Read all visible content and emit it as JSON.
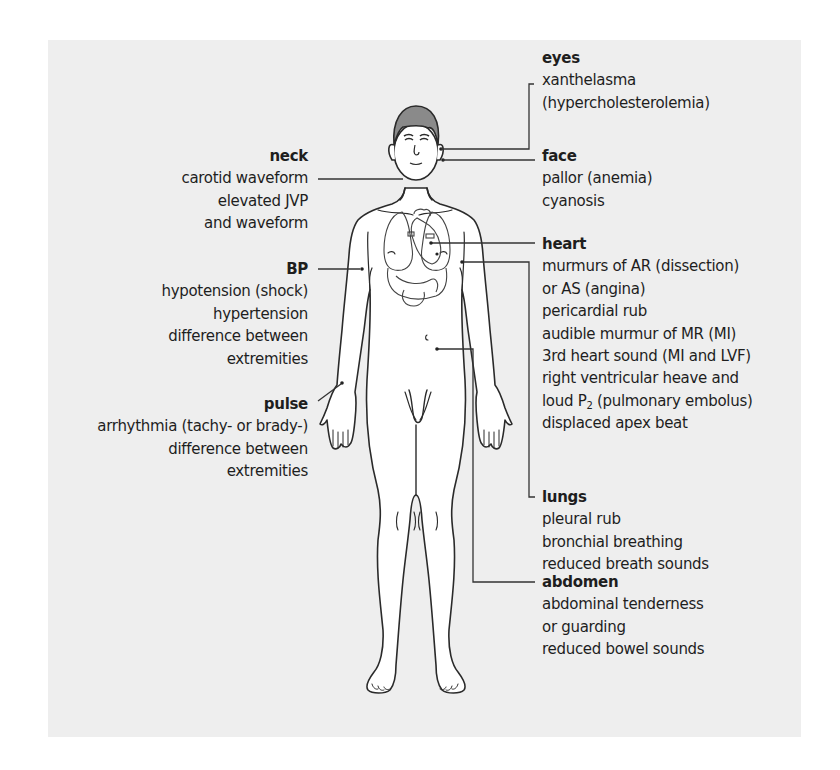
{
  "colors": {
    "panel_bg": "#eeeeee",
    "page_bg": "#ffffff",
    "text": "#1e1e1e",
    "line": "#333333",
    "hair": "#8a8a8a",
    "skin": "#ffffff"
  },
  "labels": {
    "eyes": {
      "title": "eyes",
      "lines": [
        "xanthelasma",
        "(hypercholesterolemia)"
      ]
    },
    "face": {
      "title": "face",
      "lines": [
        "pallor (anemia)",
        "cyanosis"
      ]
    },
    "heart": {
      "title": "heart",
      "lines": [
        "murmurs of AR (dissection)",
        "or AS (angina)",
        "pericardial rub",
        "audible murmur of MR (MI)",
        "3rd heart sound (MI and LVF)",
        "right ventricular heave and",
        "loud P",
        "displaced apex beat"
      ],
      "p2_sub": "2",
      "p2_rest": " (pulmonary embolus)"
    },
    "lungs": {
      "title": "lungs",
      "lines": [
        "pleural rub",
        "bronchial breathing",
        "reduced breath sounds"
      ]
    },
    "abdomen": {
      "title": "abdomen",
      "lines": [
        "abdominal tenderness",
        "or guarding",
        "reduced bowel sounds"
      ]
    },
    "neck": {
      "title": "neck",
      "lines": [
        "carotid waveform",
        "elevated JVP",
        "and waveform"
      ]
    },
    "bp": {
      "title": "BP",
      "lines": [
        "hypotension (shock)",
        "hypertension",
        "difference between",
        "extremities"
      ]
    },
    "pulse": {
      "title": "pulse",
      "lines": [
        "arrhythmia (tachy- or brady-)",
        "difference between",
        "extremities"
      ]
    }
  }
}
